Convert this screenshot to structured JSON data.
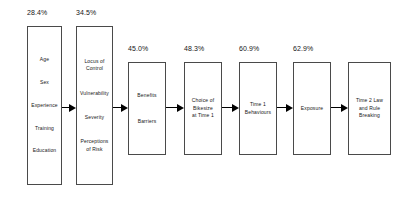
{
  "diagram": {
    "type": "flow-diagram",
    "background_color": "#ffffff",
    "box_border_color": "#4a4a4a",
    "arrow_color": "#000000",
    "text_color": "#161616",
    "nodes": [
      {
        "id": "demographics",
        "percent": "28.4%",
        "lines": [
          "Age",
          "Sex",
          "Experience",
          "Training",
          "Education"
        ]
      },
      {
        "id": "beliefs",
        "percent": "34.5%",
        "lines": [
          "Locus of",
          "Control",
          "Vulnerability",
          "Severity",
          "Perceptions",
          "of Risk"
        ]
      },
      {
        "id": "benefits-barriers",
        "percent": "45.0%",
        "lines": [
          "Benefits",
          "Barriers"
        ]
      },
      {
        "id": "choice-of-bikesize",
        "percent": "48.3%",
        "lines": [
          "Choice of",
          "Bikesize",
          "at Time 1"
        ]
      },
      {
        "id": "time-1-behaviours",
        "percent": "60.9%",
        "lines": [
          "Time 1",
          "Behaviours"
        ]
      },
      {
        "id": "exposure",
        "percent": "62.9%",
        "lines": [
          "Exposure"
        ]
      },
      {
        "id": "time-2-law-and-rule-breaking",
        "percent": "",
        "lines": [
          "Time 2 Law",
          "and Rule",
          "Breaking"
        ]
      }
    ],
    "arrows": [
      {
        "from": "demographics",
        "to": "beliefs"
      },
      {
        "from": "beliefs",
        "to": "benefits-barriers"
      },
      {
        "from": "benefits-barriers",
        "to": "choice-of-bikesize"
      },
      {
        "from": "choice-of-bikesize",
        "to": "time-1-behaviours"
      },
      {
        "from": "time-1-behaviours",
        "to": "exposure"
      },
      {
        "from": "exposure",
        "to": "time-2-law-and-rule-breaking"
      }
    ]
  }
}
